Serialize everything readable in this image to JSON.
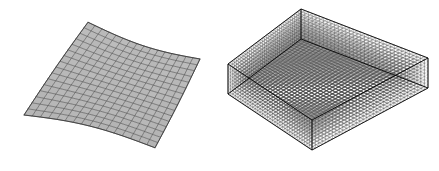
{
  "figure": {
    "background_color": "#ffffff",
    "width": 439,
    "height": 171,
    "caption": "",
    "panel_count": 2
  },
  "panels": [
    {
      "id": "surface-mesh",
      "name": "surface-mesh-panel",
      "label": "",
      "type": "structured quadrilateral surface mesh",
      "description": "Slightly warped planar quad-element shell mesh viewed in oblique projection",
      "nx": 16,
      "ny": 16,
      "element_count": 256,
      "node_count": 289,
      "element_type": "quad",
      "face_color": "#b9b9b9",
      "edge_color": "#3e3e3e",
      "edge_width": 0.55,
      "shading": "flat",
      "corners": {
        "back": [
          88,
          26
        ],
        "right": [
          200,
          66
        ],
        "front": [
          155,
          144
        ],
        "left": [
          24,
          108
        ]
      },
      "warp_amplitude": 9
    },
    {
      "id": "volume-mesh",
      "name": "volume-mesh-panel",
      "label": "",
      "type": "structured hexahedral volume mesh",
      "description": "Dense three-dimensional box-shaped hexahedral mesh viewed in oblique projection",
      "nx": 34,
      "ny": 34,
      "nz": 9,
      "element_count": 10404,
      "element_type": "hex",
      "face_color": "#f2f2f2",
      "edge_color": "#1c1c1c",
      "edge_width": 0.3,
      "shading": "wireframe",
      "corners_top": {
        "back": [
          301,
          9
        ],
        "right": [
          428,
          58
        ],
        "front": [
          312,
          120
        ],
        "left": [
          228,
          64
        ]
      },
      "depth_offset": 30
    }
  ],
  "colors": {
    "background": "#ffffff",
    "surface_face": "#b9b9b9",
    "surface_edge": "#3e3e3e",
    "volume_edge": "#1c1c1c",
    "volume_face": "#f2f2f2"
  }
}
